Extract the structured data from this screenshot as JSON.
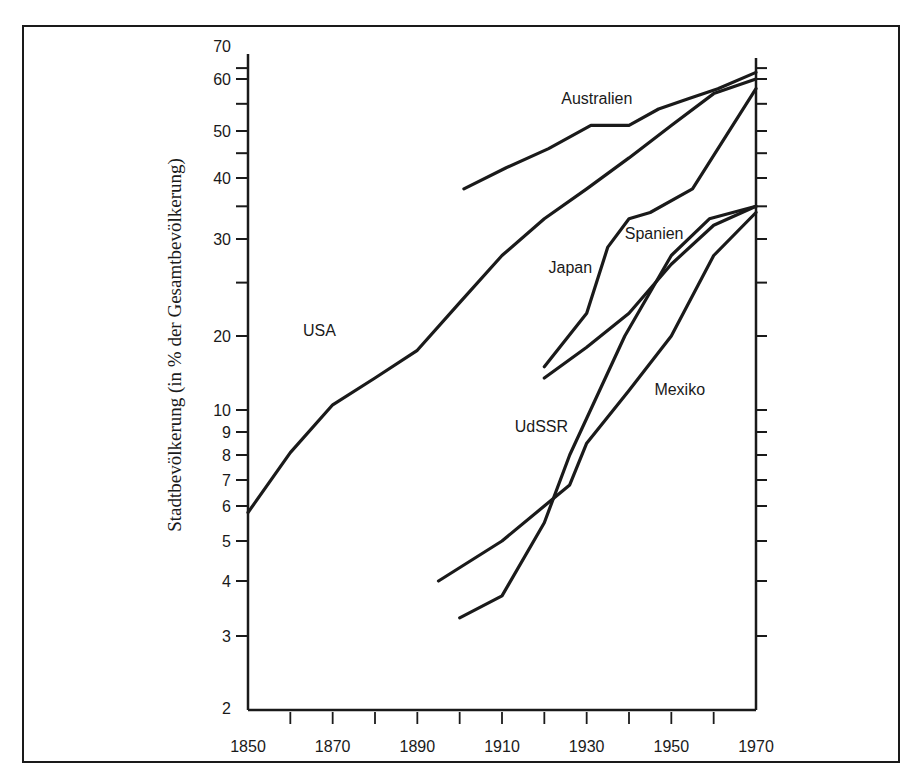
{
  "chart_data": {
    "type": "line",
    "title": "",
    "xlabel": "",
    "ylabel": "Stadtbevölkerung (in % der Gesamtbevölkerung)",
    "yscale": "log",
    "xlim": [
      1850,
      1970
    ],
    "ylim": [
      2,
      70
    ],
    "grid": false,
    "legend": "inline labels",
    "x_ticks": [
      1850,
      1860,
      1870,
      1880,
      1890,
      1900,
      1910,
      1920,
      1930,
      1940,
      1950,
      1960,
      1970
    ],
    "x_tick_labels": [
      "1850",
      "1870",
      "1890",
      "1910",
      "1930",
      "1950",
      "1970"
    ],
    "y_tick_labels": [
      "2",
      "3",
      "4",
      "5",
      "6",
      "7",
      "8",
      "9",
      "10",
      "20",
      "30",
      "40",
      "50",
      "60",
      "70"
    ],
    "series": [
      {
        "name": "USA",
        "label_pos": [
          1863,
          20
        ],
        "x": [
          1850,
          1860,
          1870,
          1880,
          1890,
          1900,
          1910,
          1920,
          1930,
          1940,
          1950,
          1960,
          1970
        ],
        "values": [
          5.8,
          8.1,
          10.5,
          13.5,
          17.5,
          23,
          28,
          33,
          38,
          44,
          51,
          57,
          60
        ]
      },
      {
        "name": "Australien",
        "label_pos": [
          1924,
          55
        ],
        "x": [
          1901,
          1911,
          1921,
          1931,
          1940,
          1947,
          1954,
          1961,
          1970
        ],
        "values": [
          38,
          42,
          46,
          51,
          51,
          54,
          56,
          58,
          63
        ]
      },
      {
        "name": "Japan",
        "label_pos": [
          1921,
          26
        ],
        "x": [
          1920,
          1930,
          1935,
          1940,
          1945,
          1955,
          1970
        ],
        "values": [
          15,
          22,
          29,
          33,
          34,
          38,
          58
        ]
      },
      {
        "name": "Spanien",
        "label_pos": [
          1939,
          30
        ],
        "x": [
          1920,
          1930,
          1940,
          1950,
          1960,
          1970
        ],
        "values": [
          13.5,
          18,
          22,
          27,
          32,
          35
        ]
      },
      {
        "name": "Mexiko",
        "label_pos": [
          1946,
          11.5
        ],
        "x": [
          1895,
          1910,
          1920,
          1926,
          1930,
          1940,
          1950,
          1960,
          1970
        ],
        "values": [
          4,
          5,
          6,
          6.8,
          8.5,
          12,
          20,
          28,
          34
        ]
      },
      {
        "name": "UdSSR",
        "label_pos": [
          1913,
          9
        ],
        "x": [
          1900,
          1910,
          1920,
          1926,
          1939,
          1950,
          1959,
          1970
        ],
        "values": [
          3.3,
          3.7,
          5.5,
          8,
          20,
          28,
          33,
          35
        ]
      }
    ]
  }
}
